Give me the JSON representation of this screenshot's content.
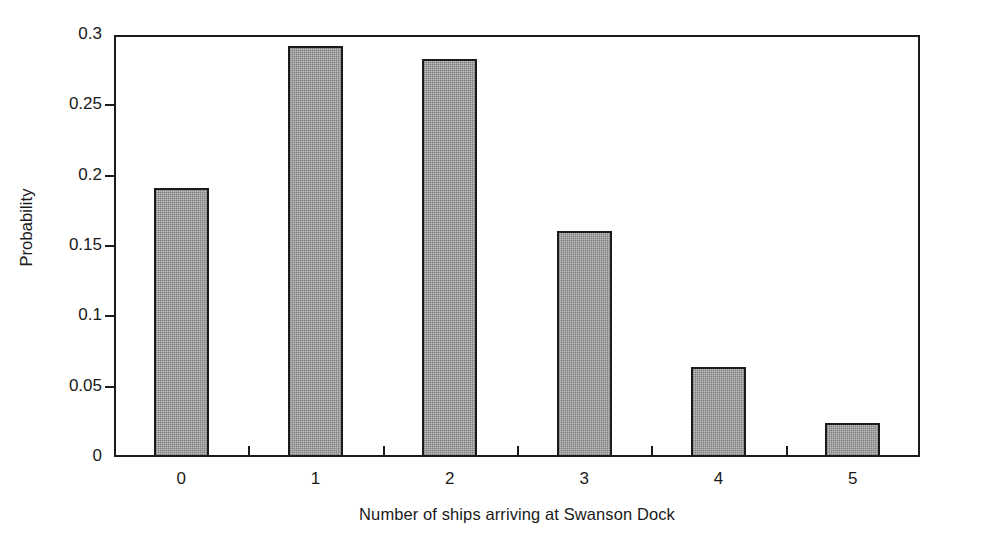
{
  "chart_data": {
    "type": "bar",
    "title": "",
    "subtitle": "",
    "xlabel": "Number of ships arriving at Swanson Dock",
    "ylabel": "Probability",
    "categories": [
      "0",
      "1",
      "2",
      "3",
      "4",
      "5"
    ],
    "values": [
      0.191,
      0.292,
      0.283,
      0.161,
      0.064,
      0.024
    ],
    "series": [
      {
        "name": "Probability",
        "values": [
          0.191,
          0.292,
          0.283,
          0.161,
          0.064,
          0.024
        ]
      }
    ],
    "ylim": [
      0,
      0.3
    ],
    "xlim": [
      -0.5,
      5.5
    ],
    "ytick_labels": [
      "0.3",
      "0.25",
      "0.2",
      "0.15",
      "0.1",
      "0.05",
      "0"
    ],
    "ytick_values": [
      0.3,
      0.25,
      0.2,
      0.15,
      0.1,
      0.05,
      0
    ],
    "xtick_labels": [
      "0",
      "1",
      "2",
      "3",
      "4",
      "5"
    ],
    "grid": false,
    "legend": false,
    "legend_position": "none",
    "bar_fill_color": "#c2c2c2",
    "bar_edge_color": "#1b1b1b",
    "axis_color": "#1b1b1b",
    "background_color": "#ffffff",
    "annotations": []
  }
}
